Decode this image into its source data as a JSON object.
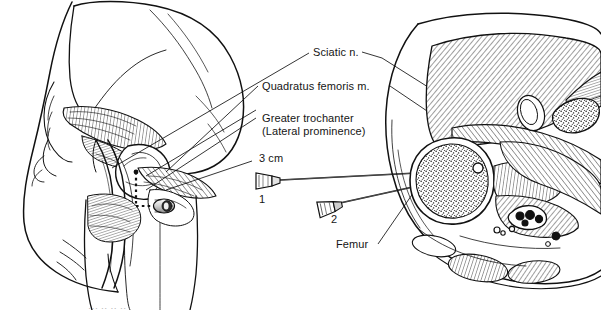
{
  "figure": {
    "type": "anatomical-illustration",
    "background_color": "#ffffff",
    "ink_color": "#111111"
  },
  "labels": {
    "sciatic_nerve": "Sciatic n.",
    "quadratus_femoris": "Quadratus femoris m.",
    "greater_trochanter": "Greater trochanter\n(Lateral prominence)",
    "greater_trochanter_line1": "Greater trochanter",
    "greater_trochanter_line2": "(Lateral prominence)",
    "distance": "3 cm",
    "femur": "Femur",
    "needle_one": "1",
    "needle_two": "2"
  },
  "panels": {
    "left": {
      "name": "posterior-hip-surface-view",
      "description": "Posterior view of hip and buttock with gluteus maximus reflected, showing greater trochanter, sciatic nerve and needle entry marking"
    },
    "right": {
      "name": "axial-cross-section",
      "description": "Axial cross-section of thigh at level of lesser trochanter showing femur, muscles and sciatic nerve with two needle trajectories"
    }
  },
  "markers": {
    "measurement_line": "3 cm dotted measurement from greater trochanter",
    "needle_hub_marker": "needle-entry-point"
  },
  "footer": {
    "cut_caption": "··· ·· ·· ··"
  }
}
